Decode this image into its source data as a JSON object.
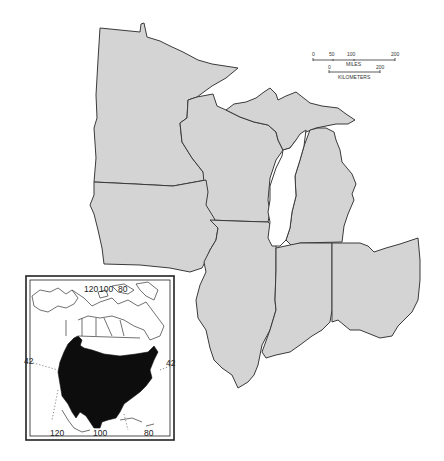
{
  "map": {
    "region": "Upper Midwest / Great Lakes states",
    "states": [
      "Minnesota",
      "Wisconsin",
      "Michigan",
      "Iowa",
      "Illinois",
      "Indiana",
      "Ohio"
    ],
    "colors": {
      "state_fill": "#d4d4d4",
      "outline": "#3a3a3a",
      "range_fill": "#0d0d0d",
      "background": "#ffffff"
    }
  },
  "scale_bar": {
    "miles_ticks": [
      "0",
      "50",
      "100",
      "200"
    ],
    "miles_label": "MILES",
    "km_ticks": [
      "0",
      "200"
    ],
    "km_label": "KILOMETERS"
  },
  "inset": {
    "title": "North America range map",
    "top_longitudes": [
      "120",
      "100",
      "80"
    ],
    "bottom_longitudes": [
      "120",
      "100",
      "80"
    ],
    "left_latitude": "42",
    "right_latitude": "42"
  }
}
